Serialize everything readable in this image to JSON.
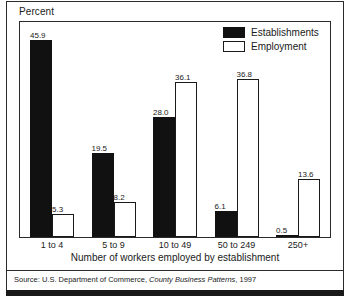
{
  "figure": {
    "y_axis_label": "Percent",
    "x_axis_title": "Number of workers employed by establishment",
    "source": {
      "prefix": "Source: U.S. Department of Commerce, ",
      "publication": "County Business Patterns",
      "suffix": ", 1997"
    }
  },
  "colors": {
    "establishments": "#111111",
    "employment": "#ffffff",
    "outline": "#1a1a1a",
    "frame": "#2b2b2b"
  },
  "chart_data": {
    "type": "bar",
    "title": "",
    "subtitle": "",
    "xlabel": "Number of workers employed by establishment",
    "ylabel": "Percent",
    "ylim": [
      0,
      50
    ],
    "grid": false,
    "legend_position": "top-right",
    "categories": [
      "1 to 4",
      "5 to 9",
      "10 to 49",
      "50 to 249",
      "250+"
    ],
    "series": [
      {
        "name": "Establishments",
        "values": [
          45.9,
          19.5,
          28.0,
          6.1,
          0.5
        ],
        "labels": [
          "45.9",
          "19.5",
          "28.0",
          "6.1",
          "0.5"
        ]
      },
      {
        "name": "Employment",
        "values": [
          5.3,
          8.2,
          36.1,
          36.8,
          13.6
        ],
        "labels": [
          "5.3",
          "8.2",
          "36.1",
          "36.8",
          "13.6"
        ]
      }
    ]
  }
}
